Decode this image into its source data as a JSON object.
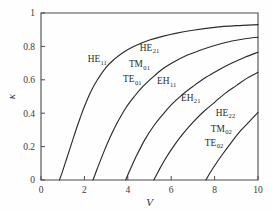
{
  "chart_data": {
    "type": "line",
    "title": "",
    "xlabel": "V",
    "ylabel": "κ",
    "xlim": [
      0,
      10
    ],
    "ylim": [
      0,
      1
    ],
    "grid": false,
    "legend_position": "inline-annotations",
    "xticks": [
      "0",
      "2",
      "4",
      "6",
      "8",
      "10"
    ],
    "xtick_values": [
      0,
      2,
      4,
      6,
      8,
      10
    ],
    "yticks": [
      "0",
      "0.2",
      "0.4",
      "0.6",
      "0.8",
      "1"
    ],
    "ytick_values": [
      0,
      0.2,
      0.4,
      0.6,
      0.8,
      1
    ],
    "series": [
      {
        "name": "HE11",
        "cutoff_V": 0.85,
        "value_at_V10": 0.93,
        "x": [
          0.85,
          1.0,
          1.2,
          1.4,
          1.6,
          1.8,
          2.0,
          2.3,
          2.6,
          3.0,
          3.4,
          3.8,
          4.2,
          4.6,
          5.0,
          5.6,
          6.2,
          7.0,
          8.0,
          9.0,
          10.0
        ],
        "values": [
          0.0,
          0.055,
          0.135,
          0.215,
          0.295,
          0.37,
          0.44,
          0.53,
          0.6,
          0.675,
          0.725,
          0.765,
          0.795,
          0.818,
          0.838,
          0.86,
          0.878,
          0.897,
          0.914,
          0.924,
          0.93
        ]
      },
      {
        "name": "HE21-TM01-TE01",
        "cutoff_V": 2.4,
        "value_at_V10": 0.855,
        "x": [
          2.4,
          2.6,
          2.9,
          3.2,
          3.5,
          3.9,
          4.3,
          4.7,
          5.1,
          5.6,
          6.1,
          6.7,
          7.3,
          8.0,
          8.8,
          9.4,
          10.0
        ],
        "values": [
          0.0,
          0.07,
          0.17,
          0.26,
          0.34,
          0.43,
          0.5,
          0.56,
          0.61,
          0.665,
          0.705,
          0.745,
          0.775,
          0.805,
          0.832,
          0.846,
          0.855
        ]
      },
      {
        "name": "EH11",
        "cutoff_V": 3.9,
        "value_at_V10": 0.765,
        "x": [
          3.9,
          4.1,
          4.4,
          4.8,
          5.2,
          5.6,
          6.0,
          6.5,
          7.0,
          7.6,
          8.2,
          8.8,
          9.4,
          10.0
        ],
        "values": [
          0.0,
          0.06,
          0.145,
          0.245,
          0.325,
          0.39,
          0.45,
          0.51,
          0.56,
          0.615,
          0.66,
          0.7,
          0.735,
          0.765
        ]
      },
      {
        "name": "EH21",
        "cutoff_V": 5.2,
        "value_at_V10": 0.645,
        "x": [
          5.2,
          5.4,
          5.7,
          6.1,
          6.5,
          7.0,
          7.5,
          8.0,
          8.5,
          9.0,
          9.5,
          10.0
        ],
        "values": [
          0.0,
          0.05,
          0.12,
          0.2,
          0.27,
          0.345,
          0.41,
          0.465,
          0.52,
          0.565,
          0.61,
          0.645
        ]
      },
      {
        "name": "HE22-TM02-TE02",
        "cutoff_V": 7.6,
        "value_at_V10": 0.405,
        "x": [
          7.6,
          7.8,
          8.1,
          8.4,
          8.8,
          9.2,
          9.6,
          10.0
        ],
        "values": [
          0.0,
          0.045,
          0.105,
          0.16,
          0.23,
          0.295,
          0.35,
          0.405
        ]
      }
    ],
    "annotations": [
      {
        "id": "HE11",
        "base": "HE",
        "sub": "11",
        "x_data": 2.15,
        "y_data": 0.705
      },
      {
        "id": "HE21",
        "base": "HE",
        "sub": "21",
        "x_data": 4.55,
        "y_data": 0.775
      },
      {
        "id": "TM01",
        "base": "TM",
        "sub": "01",
        "x_data": 4.05,
        "y_data": 0.675
      },
      {
        "id": "TE01",
        "base": "TE",
        "sub": "01",
        "x_data": 3.78,
        "y_data": 0.585
      },
      {
        "id": "EH11",
        "base": "EH",
        "sub": "11",
        "x_data": 5.35,
        "y_data": 0.575
      },
      {
        "id": "EH21",
        "base": "EH",
        "sub": "21",
        "x_data": 6.45,
        "y_data": 0.475
      },
      {
        "id": "HE22",
        "base": "HE",
        "sub": "22",
        "x_data": 8.05,
        "y_data": 0.385
      },
      {
        "id": "TM02",
        "base": "TM",
        "sub": "02",
        "x_data": 7.82,
        "y_data": 0.29
      },
      {
        "id": "TE02",
        "base": "TE",
        "sub": "02",
        "x_data": 7.55,
        "y_data": 0.205
      }
    ],
    "colors": {
      "curve": "#2b2b2b",
      "axis": "#4a4a4a",
      "background": "#fefefe",
      "text": "#2b2b2b"
    }
  }
}
